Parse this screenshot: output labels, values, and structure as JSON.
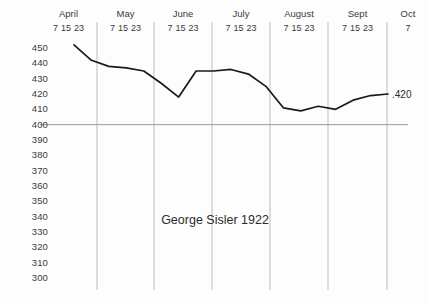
{
  "chart_data": {
    "type": "line",
    "title": "George Sisler 1922",
    "xlabel": "",
    "ylabel": "",
    "ylim": [
      300,
      450
    ],
    "ytick_labels": [
      "450",
      "440",
      "430",
      "420",
      "410",
      "400",
      "390",
      "380",
      "370",
      "360",
      "350",
      "340",
      "330",
      "320",
      "310",
      "300"
    ],
    "ytick_values": [
      450,
      440,
      430,
      420,
      410,
      400,
      390,
      380,
      370,
      360,
      350,
      340,
      330,
      320,
      310,
      300
    ],
    "grid": "vertical month dividers plus single horizontal reference line at 400",
    "reference_line": 400,
    "legend": "none",
    "annotations": [
      {
        "text": ".420",
        "x_value": "Oct 7",
        "y_value": 420
      }
    ],
    "months": [
      {
        "name": "April",
        "days": [
          "7",
          "15",
          "23"
        ]
      },
      {
        "name": "May",
        "days": [
          "7",
          "15",
          "23"
        ]
      },
      {
        "name": "June",
        "days": [
          "7",
          "15",
          "23"
        ]
      },
      {
        "name": "July",
        "days": [
          "7",
          "15",
          "23"
        ]
      },
      {
        "name": "August",
        "days": [
          "7",
          "15",
          "23"
        ]
      },
      {
        "name": "Sept",
        "days": [
          "7",
          "15",
          "23"
        ]
      },
      {
        "name": "Oct",
        "days": [
          "7"
        ]
      }
    ],
    "x": [
      "Apr 7",
      "Apr 15",
      "Apr 23",
      "May 7",
      "May 15",
      "May 23",
      "Jun 7",
      "Jun 15",
      "Jun 23",
      "Jul 7",
      "Jul 15",
      "Jul 23",
      "Aug 7",
      "Aug 15",
      "Aug 23",
      "Sep 7",
      "Sep 15",
      "Sep 23",
      "Oct 7"
    ],
    "values": [
      452,
      442,
      438,
      437,
      435,
      427,
      418,
      435,
      435,
      436,
      433,
      425,
      411,
      409,
      412,
      410,
      416,
      419,
      420
    ],
    "series": [
      {
        "name": "Batting average",
        "color": "#1a1a1a",
        "values": [
          452,
          442,
          438,
          437,
          435,
          427,
          418,
          435,
          435,
          436,
          433,
          425,
          411,
          409,
          412,
          410,
          416,
          419,
          420
        ]
      }
    ]
  },
  "colors": {
    "line": "#1a1a1a",
    "gridline": "#bdbdbd",
    "reference_line": "#9a9a9a",
    "text": "#3a3a3a",
    "background": "#fdfdfd"
  }
}
